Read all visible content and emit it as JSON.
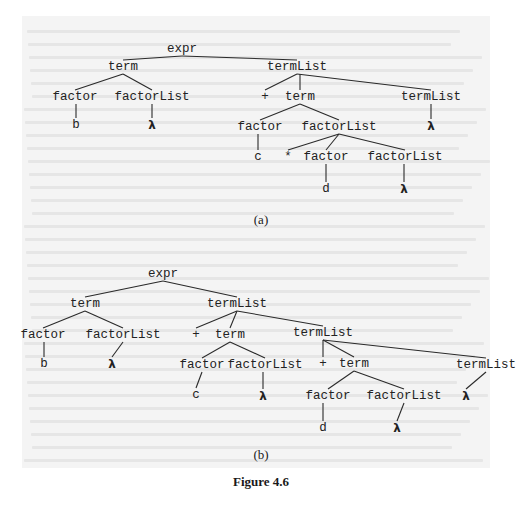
{
  "figure": {
    "caption": "Figure 4.6",
    "background_color": "#f4f4f4",
    "ink_color": "#222222",
    "trees": [
      {
        "label": "(a)",
        "nodes": [
          {
            "id": "a0",
            "text": "expr",
            "x": 182,
            "y": 49
          },
          {
            "id": "a1",
            "text": "term",
            "x": 123,
            "y": 67
          },
          {
            "id": "a2",
            "text": "termList",
            "x": 297,
            "y": 67
          },
          {
            "id": "a3",
            "text": "factor",
            "x": 75,
            "y": 97
          },
          {
            "id": "a4",
            "text": "factorList",
            "x": 152,
            "y": 97
          },
          {
            "id": "a5",
            "text": "+",
            "x": 265,
            "y": 97
          },
          {
            "id": "a6",
            "text": "term",
            "x": 300,
            "y": 97
          },
          {
            "id": "a7",
            "text": "termList",
            "x": 431,
            "y": 97
          },
          {
            "id": "a8",
            "text": "b",
            "x": 76,
            "y": 125
          },
          {
            "id": "a9",
            "text": "λ",
            "x": 152,
            "y": 125
          },
          {
            "id": "a10",
            "text": "factor",
            "x": 260,
            "y": 127
          },
          {
            "id": "a11",
            "text": "factorList",
            "x": 339,
            "y": 127
          },
          {
            "id": "a12",
            "text": "λ",
            "x": 431,
            "y": 126
          },
          {
            "id": "a13",
            "text": "c",
            "x": 258,
            "y": 157
          },
          {
            "id": "a14",
            "text": "*",
            "x": 288,
            "y": 157
          },
          {
            "id": "a15",
            "text": "factor",
            "x": 326,
            "y": 157
          },
          {
            "id": "a16",
            "text": "factorList",
            "x": 405,
            "y": 157
          },
          {
            "id": "a17",
            "text": "d",
            "x": 326,
            "y": 189
          },
          {
            "id": "a18",
            "text": "λ",
            "x": 404,
            "y": 189
          }
        ],
        "edges": [
          [
            "a0",
            "a1"
          ],
          [
            "a0",
            "a2"
          ],
          [
            "a1",
            "a3"
          ],
          [
            "a1",
            "a4"
          ],
          [
            "a2",
            "a5"
          ],
          [
            "a2",
            "a6"
          ],
          [
            "a2",
            "a7"
          ],
          [
            "a3",
            "a8"
          ],
          [
            "a4",
            "a9"
          ],
          [
            "a6",
            "a10"
          ],
          [
            "a6",
            "a11"
          ],
          [
            "a7",
            "a12"
          ],
          [
            "a10",
            "a13"
          ],
          [
            "a11",
            "a14"
          ],
          [
            "a11",
            "a15"
          ],
          [
            "a11",
            "a16"
          ],
          [
            "a15",
            "a17"
          ],
          [
            "a16",
            "a18"
          ]
        ],
        "label_pos": {
          "x": 261,
          "y": 212
        }
      },
      {
        "label": "(b)",
        "nodes": [
          {
            "id": "b0",
            "text": "expr",
            "x": 163,
            "y": 274
          },
          {
            "id": "b1",
            "text": "term",
            "x": 85,
            "y": 304
          },
          {
            "id": "b2",
            "text": "termList",
            "x": 237,
            "y": 304
          },
          {
            "id": "b3",
            "text": "factor",
            "x": 43,
            "y": 335
          },
          {
            "id": "b4",
            "text": "factorList",
            "x": 123,
            "y": 335
          },
          {
            "id": "b5",
            "text": "+",
            "x": 196,
            "y": 335
          },
          {
            "id": "b6",
            "text": "term",
            "x": 230,
            "y": 335
          },
          {
            "id": "b7",
            "text": "termList",
            "x": 323,
            "y": 333
          },
          {
            "id": "b8",
            "text": "b",
            "x": 44,
            "y": 364
          },
          {
            "id": "b9",
            "text": "λ",
            "x": 112,
            "y": 364
          },
          {
            "id": "b10",
            "text": "factor",
            "x": 202,
            "y": 365
          },
          {
            "id": "b11",
            "text": "factorList",
            "x": 265,
            "y": 365
          },
          {
            "id": "b12",
            "text": "+",
            "x": 323,
            "y": 364
          },
          {
            "id": "b13",
            "text": "term",
            "x": 354,
            "y": 364
          },
          {
            "id": "b14",
            "text": "termList",
            "x": 486,
            "y": 365
          },
          {
            "id": "b15",
            "text": "c",
            "x": 196,
            "y": 395
          },
          {
            "id": "b16",
            "text": "λ",
            "x": 263,
            "y": 396
          },
          {
            "id": "b17",
            "text": "factor",
            "x": 328,
            "y": 396
          },
          {
            "id": "b18",
            "text": "factorList",
            "x": 404,
            "y": 396
          },
          {
            "id": "b19",
            "text": "λ",
            "x": 466,
            "y": 396
          },
          {
            "id": "b20",
            "text": "d",
            "x": 323,
            "y": 428
          },
          {
            "id": "b21",
            "text": "λ",
            "x": 397,
            "y": 428
          }
        ],
        "edges": [
          [
            "b0",
            "b1"
          ],
          [
            "b0",
            "b2"
          ],
          [
            "b1",
            "b3"
          ],
          [
            "b1",
            "b4"
          ],
          [
            "b2",
            "b5"
          ],
          [
            "b2",
            "b6"
          ],
          [
            "b2",
            "b7"
          ],
          [
            "b3",
            "b8"
          ],
          [
            "b4",
            "b9"
          ],
          [
            "b6",
            "b10"
          ],
          [
            "b6",
            "b11"
          ],
          [
            "b7",
            "b12"
          ],
          [
            "b7",
            "b13"
          ],
          [
            "b7",
            "b14"
          ],
          [
            "b10",
            "b15"
          ],
          [
            "b11",
            "b16"
          ],
          [
            "b13",
            "b17"
          ],
          [
            "b13",
            "b18"
          ],
          [
            "b14",
            "b19"
          ],
          [
            "b17",
            "b20"
          ],
          [
            "b18",
            "b21"
          ]
        ],
        "label_pos": {
          "x": 261,
          "y": 447
        }
      }
    ],
    "caption_pos": {
      "x": 261,
      "y": 474
    }
  }
}
